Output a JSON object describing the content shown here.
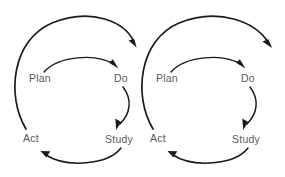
{
  "diagram": {
    "background_color": "#ffffff",
    "line_color": "#1a1a1a",
    "label_color": "#5a5a5a",
    "cycles": [
      {
        "id": "cycle-left",
        "nodes": {
          "plan": "Plan",
          "do": "Do",
          "study": "Study",
          "act": "Act"
        }
      },
      {
        "id": "cycle-right",
        "nodes": {
          "plan": "Plan",
          "do": "Do",
          "study": "Study",
          "act": "Act"
        }
      }
    ]
  }
}
